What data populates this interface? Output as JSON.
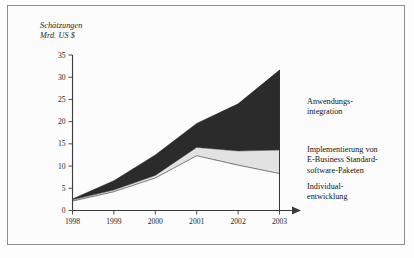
{
  "figure": {
    "axis_title_line1": "Schätzungen",
    "axis_title_line2": "Mrd. US $"
  },
  "legend": {
    "anwendung_line1": "Anwendungs-",
    "anwendung_line2": "integration",
    "implementierung_line1": "Implementierung von",
    "implementierung_line2": "E-Business Standard-",
    "implementierung_line3": "software-Paketen",
    "individual_line1": "Individual-",
    "individual_line2": "entwicklung"
  },
  "axes": {
    "y_ticks": [
      "0",
      "5",
      "10",
      "15",
      "20",
      "25",
      "30",
      "35"
    ],
    "x_ticks": [
      "1998",
      "1999",
      "2000",
      "2001",
      "2002",
      "2003"
    ]
  },
  "colors": {
    "series_dark": "#2b2b2b",
    "series_light": "#e2e2e2",
    "series_white": "#fcfcfc",
    "axis": "#3a3a3a",
    "frame": "#8d8d8d"
  },
  "chart_data": {
    "type": "area",
    "stacked": true,
    "title": "",
    "subtitle": "",
    "xlabel": "",
    "ylabel": "Schätzungen Mrd. US $",
    "x": [
      1998,
      1999,
      2000,
      2001,
      2002,
      2003
    ],
    "categories": [
      "1998",
      "1999",
      "2000",
      "2001",
      "2002",
      "2003"
    ],
    "ylim": [
      0,
      35
    ],
    "xlim": [
      1998,
      2003
    ],
    "grid": false,
    "legend_position": "right",
    "series": [
      {
        "name": "Individualentwicklung",
        "color": "#fcfcfc",
        "values": [
          2.1,
          4.2,
          7.3,
          12.3,
          10.2,
          8.3
        ]
      },
      {
        "name": "Implementierung von E-Business Standardsoftware-Paketen",
        "color": "#e2e2e2",
        "values": [
          0.3,
          0.4,
          0.6,
          1.9,
          3.2,
          5.3
        ]
      },
      {
        "name": "Anwendungsintegration",
        "color": "#2b2b2b",
        "values": [
          0.2,
          2.1,
          4.6,
          5.4,
          10.6,
          18.0
        ]
      }
    ],
    "cumulative_totals": [
      2.6,
      6.7,
      12.5,
      19.6,
      24.0,
      31.6
    ],
    "cumulative_lower_band": [
      2.4,
      4.6,
      7.9,
      14.2,
      13.4,
      13.6
    ]
  }
}
